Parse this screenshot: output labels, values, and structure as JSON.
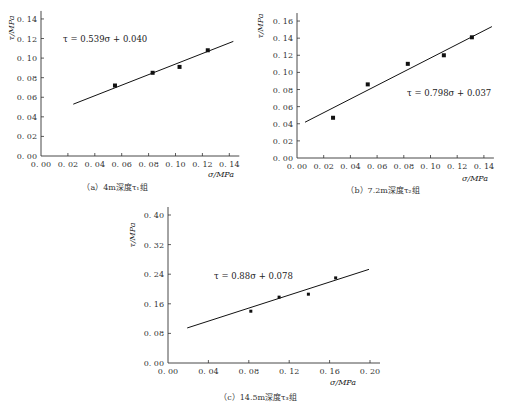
{
  "chart_data": [
    {
      "id": "a",
      "type": "scatter",
      "caption": "（a）4m深度τ₁组",
      "xlabel": "σ/MPa",
      "ylabel": "τ/MPa",
      "xlim": [
        0,
        0.14
      ],
      "ylim": [
        0,
        0.14
      ],
      "xticks": [
        "0.00",
        "0.02",
        "0.04",
        "0.06",
        "0.08",
        "0.10",
        "0.12",
        "0.14"
      ],
      "yticks": [
        "0.00",
        "0.02",
        "0.04",
        "0.06",
        "0.08",
        "0.10",
        "0.12",
        "0.14"
      ],
      "x": [
        0.055,
        0.083,
        0.103,
        0.124
      ],
      "y": [
        0.072,
        0.085,
        0.091,
        0.108
      ],
      "fit": {
        "slope": 0.539,
        "intercept": 0.04,
        "x_range": [
          0.024,
          0.143
        ]
      },
      "equation": "τ = 0.539σ + 0.040",
      "grid": false
    },
    {
      "id": "b",
      "type": "scatter",
      "caption": "（b）7.2m深度τ₂组",
      "xlabel": "σ/MPa",
      "ylabel": "τ/MPa",
      "xlim": [
        0,
        0.14
      ],
      "ylim": [
        0,
        0.16
      ],
      "xticks": [
        "0.00",
        "0.02",
        "0.04",
        "0.06",
        "0.08",
        "0.10",
        "0.12",
        "0.14"
      ],
      "yticks": [
        "0.00",
        "0.02",
        "0.04",
        "0.06",
        "0.08",
        "0.10",
        "0.12",
        "0.14",
        "0.16"
      ],
      "x": [
        0.027,
        0.053,
        0.083,
        0.11,
        0.131
      ],
      "y": [
        0.047,
        0.086,
        0.11,
        0.12,
        0.141
      ],
      "fit": {
        "slope": 0.798,
        "intercept": 0.037,
        "x_range": [
          0.006,
          0.146
        ]
      },
      "equation": "τ = 0.798σ + 0.037",
      "grid": false
    },
    {
      "id": "c",
      "type": "scatter",
      "caption": "（c）14.5m深度τ₃组",
      "xlabel": "σ/MPa",
      "ylabel": "τ/MPa",
      "xlim": [
        0,
        0.2
      ],
      "ylim": [
        0,
        0.4
      ],
      "xticks": [
        "0.00",
        "0.04",
        "0.08",
        "0.12",
        "0.16",
        "0.20"
      ],
      "yticks": [
        "0.00",
        "0.08",
        "0.16",
        "0.24",
        "0.32",
        "0.40"
      ],
      "x": [
        0.082,
        0.11,
        0.139,
        0.166
      ],
      "y": [
        0.14,
        0.178,
        0.186,
        0.23
      ],
      "fit": {
        "slope": 0.88,
        "intercept": 0.078,
        "x_range": [
          0.019,
          0.199
        ]
      },
      "equation": "τ = 0.88σ + 0.078",
      "grid": false
    }
  ],
  "layout": {
    "panels": [
      {
        "x0": 41,
        "y0": 156,
        "pxPerX": 1345,
        "pxPerY": 979,
        "xTickStep": 0.02,
        "yTickStep": 0.02,
        "eqPos": [
          63,
          42
        ],
        "xlabelPos": [
          208,
          177
        ],
        "ylabelPos": [
          14,
          28
        ],
        "captionPos": [
          115,
          190
        ]
      },
      {
        "x0": 297,
        "y0": 158,
        "pxPerX": 1335,
        "pxPerY": 856,
        "xTickStep": 0.02,
        "yTickStep": 0.02,
        "eqPos": [
          407,
          96
        ],
        "xlabelPos": [
          462,
          181
        ],
        "ylabelPos": [
          263,
          26
        ],
        "captionPos": [
          383,
          193
        ]
      },
      {
        "x0": 168,
        "y0": 363,
        "pxPerX": 1010,
        "pxPerY": 370,
        "xTickStep": 0.04,
        "yTickStep": 0.08,
        "eqPos": [
          214,
          279
        ],
        "xlabelPos": [
          330,
          385
        ],
        "ylabelPos": [
          135,
          235
        ],
        "captionPos": [
          258,
          400
        ]
      }
    ]
  }
}
